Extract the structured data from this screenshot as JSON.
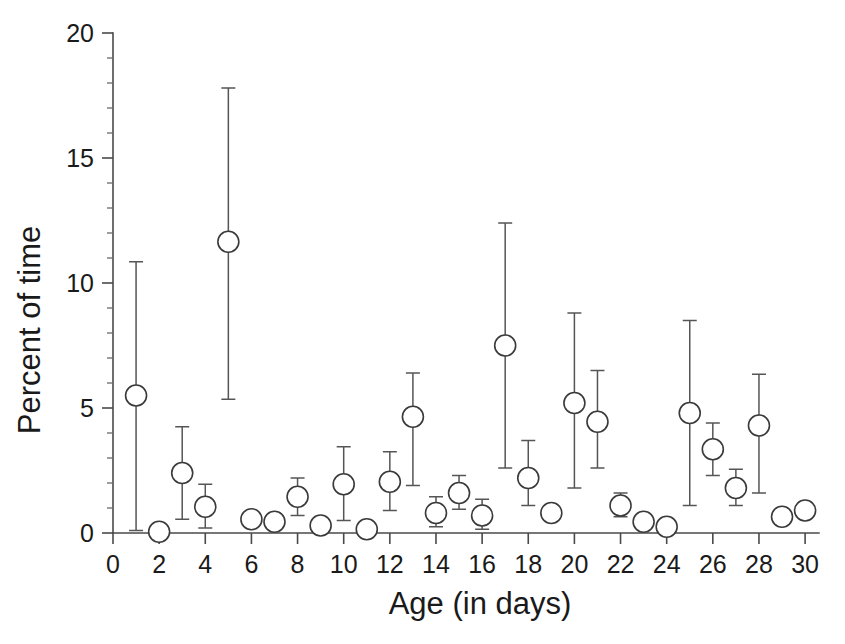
{
  "chart_data": {
    "type": "scatter",
    "title": "",
    "xlabel": "Age (in days)",
    "ylabel": "Percent of time",
    "xlim": [
      0,
      30.6
    ],
    "ylim": [
      0,
      20
    ],
    "grid": false,
    "legend": "none",
    "marker_style": "open-circle",
    "error_bars": "vertical",
    "x_ticks_major": [
      0,
      2,
      4,
      6,
      8,
      10,
      12,
      14,
      16,
      18,
      20,
      22,
      24,
      26,
      28,
      30
    ],
    "x_ticks_minor": [
      1,
      3,
      5,
      7,
      9,
      11,
      13,
      15,
      17,
      19,
      21,
      23,
      25,
      27,
      29
    ],
    "x_tick_labels": [
      "0",
      "2",
      "4",
      "6",
      "8",
      "10",
      "12",
      "14",
      "16",
      "18",
      "20",
      "22",
      "24",
      "26",
      "28",
      "30"
    ],
    "y_ticks_major": [
      0,
      5,
      10,
      15,
      20
    ],
    "y_ticks_minor": [
      1,
      2,
      3,
      4,
      6,
      7,
      8,
      9,
      11,
      12,
      13,
      14,
      16,
      17,
      18,
      19
    ],
    "y_tick_labels": [
      "0",
      "5",
      "10",
      "15",
      "20"
    ],
    "x": [
      1,
      2,
      3,
      4,
      5,
      6,
      7,
      8,
      9,
      10,
      11,
      12,
      13,
      14,
      15,
      16,
      17,
      18,
      19,
      20,
      21,
      22,
      23,
      24,
      25,
      26,
      27,
      28,
      29,
      30
    ],
    "values": [
      5.5,
      0.05,
      2.4,
      1.05,
      11.65,
      0.55,
      0.45,
      1.45,
      0.3,
      1.95,
      0.15,
      2.05,
      4.65,
      0.8,
      1.6,
      0.7,
      7.5,
      2.2,
      0.8,
      5.2,
      4.45,
      1.1,
      0.45,
      0.25,
      4.8,
      3.35,
      1.8,
      4.3,
      0.65,
      0.9
    ],
    "err_upper": [
      10.85,
      0.2,
      4.25,
      1.95,
      17.8,
      0.85,
      0.75,
      2.2,
      0.55,
      3.45,
      0.3,
      3.25,
      6.4,
      1.45,
      2.3,
      1.35,
      12.4,
      3.7,
      1.0,
      8.8,
      6.5,
      1.6,
      0.7,
      0.45,
      8.5,
      4.4,
      2.55,
      6.35,
      0.85,
      1.05
    ],
    "err_lower": [
      0.1,
      0.0,
      0.55,
      0.2,
      5.35,
      0.25,
      0.2,
      0.7,
      0.1,
      0.5,
      0.05,
      0.9,
      1.9,
      0.25,
      0.95,
      0.15,
      2.6,
      1.1,
      0.6,
      1.8,
      2.6,
      0.65,
      0.2,
      0.1,
      1.1,
      2.3,
      1.1,
      1.6,
      0.45,
      0.75
    ]
  },
  "colors": {
    "marker_stroke": "#3a3a3a",
    "marker_fill": "#ffffff",
    "error_bar": "#555555",
    "axis": "#4a4a4a",
    "text": "#1a1a1a",
    "background": "#ffffff"
  }
}
